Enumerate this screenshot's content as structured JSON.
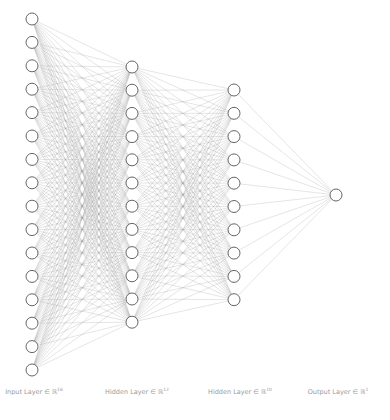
{
  "diagram": {
    "type": "fully-connected-neural-network",
    "colors": {
      "edge": "#9a9a9a",
      "node_stroke": "#555555",
      "node_fill": "#ffffff",
      "label": "#9a9a9a"
    },
    "node_radius": 6,
    "layers": [
      {
        "name": "input",
        "label": "Input Layer ∈ ℝ",
        "dim": "16",
        "size": 16,
        "x": 32,
        "y_start": 19,
        "y_step": 23.4,
        "label_x": 34
      },
      {
        "name": "hidden-1",
        "label": "Hidden Layer ∈ ℝ",
        "dim": "12",
        "size": 12,
        "x": 132,
        "y_start": 67,
        "y_step": 23.2,
        "label_x": 137
      },
      {
        "name": "hidden-2",
        "label": "Hidden Layer ∈ ℝ",
        "dim": "10",
        "size": 10,
        "x": 234,
        "y_start": 90,
        "y_step": 23.3,
        "label_x": 240
      },
      {
        "name": "output",
        "label": "Output Layer ∈ ℝ",
        "dim": "1",
        "size": 1,
        "x": 336,
        "y_start": 195,
        "y_step": 0,
        "label_x": 338
      }
    ]
  }
}
